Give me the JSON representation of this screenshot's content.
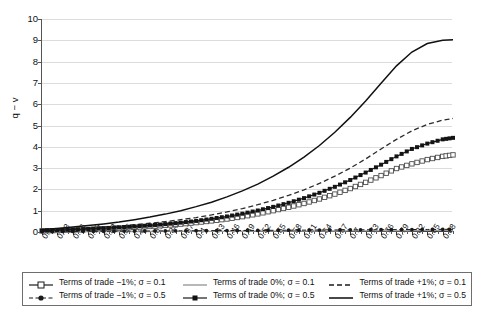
{
  "chart_data": {
    "type": "line",
    "title": "",
    "xlabel": "",
    "ylabel": "q − v",
    "xlim": [
      0.1,
      0.9
    ],
    "ylim": [
      0,
      10
    ],
    "grid": true,
    "legend_position": "bottom",
    "y_ticks": [
      "0",
      "1",
      "2",
      "3",
      "4",
      "5",
      "6",
      "7",
      "8",
      "9",
      "10"
    ],
    "x_tick_labels": [
      "0.1",
      "0.13",
      "0.16",
      "0.19",
      "0.22",
      "0.25",
      "0.28",
      "0.31",
      "0.34",
      "0.37",
      "0.4",
      "0.43",
      "0.46",
      "0.49",
      "0.52",
      "0.55",
      "0.58",
      "0.61",
      "0.64",
      "0.67",
      "0.7",
      "0.73",
      "0.76",
      "0.79",
      "0.82",
      "0.85",
      "0.88"
    ],
    "x": [
      0.1,
      0.13,
      0.16,
      0.19,
      0.22,
      0.25,
      0.28,
      0.31,
      0.34,
      0.37,
      0.4,
      0.43,
      0.46,
      0.49,
      0.52,
      0.55,
      0.58,
      0.61,
      0.64,
      0.67,
      0.7,
      0.73,
      0.76,
      0.79,
      0.82,
      0.85,
      0.88,
      0.9
    ],
    "series": [
      {
        "name": "Terms of trade −1%; σ = 0.1",
        "style": "solid-open-square",
        "color": "#4d4d4d",
        "values": [
          0.05,
          0.07,
          0.09,
          0.12,
          0.15,
          0.18,
          0.22,
          0.26,
          0.31,
          0.37,
          0.44,
          0.52,
          0.61,
          0.72,
          0.85,
          1.0,
          1.16,
          1.34,
          1.55,
          1.78,
          2.04,
          2.33,
          2.65,
          2.98,
          3.2,
          3.4,
          3.55,
          3.62
        ]
      },
      {
        "name": "Terms of trade 0%; σ = 0.1",
        "style": "solid-light",
        "color": "#9a9a9a",
        "values": [
          0.01,
          0.012,
          0.014,
          0.016,
          0.018,
          0.02,
          0.022,
          0.024,
          0.026,
          0.028,
          0.03,
          0.032,
          0.034,
          0.036,
          0.038,
          0.04,
          0.042,
          0.044,
          0.046,
          0.048,
          0.05,
          0.052,
          0.054,
          0.056,
          0.058,
          0.06,
          0.062,
          0.063
        ]
      },
      {
        "name": "Terms of trade +1%; σ = 0.1",
        "style": "dashed",
        "color": "#2b2b2b",
        "values": [
          0.07,
          0.1,
          0.14,
          0.18,
          0.23,
          0.28,
          0.34,
          0.41,
          0.49,
          0.58,
          0.68,
          0.8,
          0.94,
          1.1,
          1.28,
          1.49,
          1.72,
          1.98,
          2.28,
          2.62,
          3.0,
          3.43,
          3.9,
          4.35,
          4.75,
          5.05,
          5.25,
          5.33
        ]
      },
      {
        "name": "Terms of trade −1%; σ = 0.5",
        "style": "dashed-dot-marker",
        "color": "#1a1a1a",
        "values": [
          0.02,
          0.024,
          0.028,
          0.032,
          0.036,
          0.04,
          0.044,
          0.048,
          0.052,
          0.056,
          0.06,
          0.064,
          0.068,
          0.072,
          0.076,
          0.08,
          0.084,
          0.088,
          0.092,
          0.096,
          0.1,
          0.104,
          0.108,
          0.112,
          0.116,
          0.12,
          0.124,
          0.126
        ]
      },
      {
        "name": "Terms of trade 0%; σ = 0.5",
        "style": "solid-filled-square",
        "color": "#141414",
        "values": [
          0.06,
          0.085,
          0.11,
          0.14,
          0.175,
          0.215,
          0.26,
          0.31,
          0.37,
          0.44,
          0.52,
          0.62,
          0.73,
          0.86,
          1.01,
          1.18,
          1.37,
          1.59,
          1.84,
          2.12,
          2.44,
          2.79,
          3.16,
          3.55,
          3.9,
          4.15,
          4.35,
          4.42
        ]
      },
      {
        "name": "Terms of trade +1%; σ = 0.5",
        "style": "solid-thick",
        "color": "#111111",
        "values": [
          0.12,
          0.17,
          0.23,
          0.3,
          0.38,
          0.47,
          0.58,
          0.7,
          0.84,
          1.0,
          1.19,
          1.4,
          1.65,
          1.93,
          2.25,
          2.62,
          3.04,
          3.52,
          4.06,
          4.68,
          5.38,
          6.15,
          6.98,
          7.8,
          8.45,
          8.85,
          9.0,
          9.02
        ]
      }
    ],
    "legend_entries": [
      {
        "label": "Terms of trade −1%; σ = 0.1",
        "key": "solid-open-square"
      },
      {
        "label": "Terms of trade 0%; σ = 0.1",
        "key": "solid-light"
      },
      {
        "label": "Terms of trade +1%; σ = 0.1",
        "key": "dashed"
      },
      {
        "label": "Terms of trade −1%; σ = 0.5",
        "key": "dashed-dot-marker"
      },
      {
        "label": "Terms of trade 0%; σ = 0.5",
        "key": "solid-filled-square"
      },
      {
        "label": "Terms of trade +1%; σ = 0.5",
        "key": "solid-thick"
      }
    ]
  }
}
